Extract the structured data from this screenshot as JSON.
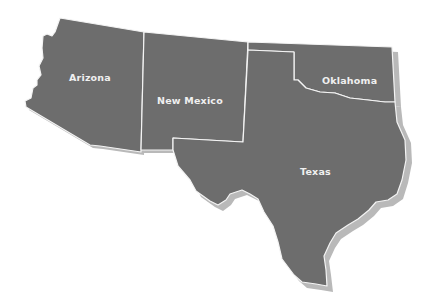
{
  "map": {
    "title": "",
    "fill_color": "#6d6d6d",
    "border_color": "#f4f4f4",
    "shadow_color": "#b9b9b9",
    "background": "#ffffff",
    "states": [
      {
        "id": "arizona",
        "label": "Arizona"
      },
      {
        "id": "new-mexico",
        "label": "New Mexico"
      },
      {
        "id": "oklahoma",
        "label": "Oklahoma"
      },
      {
        "id": "texas",
        "label": "Texas"
      }
    ]
  }
}
